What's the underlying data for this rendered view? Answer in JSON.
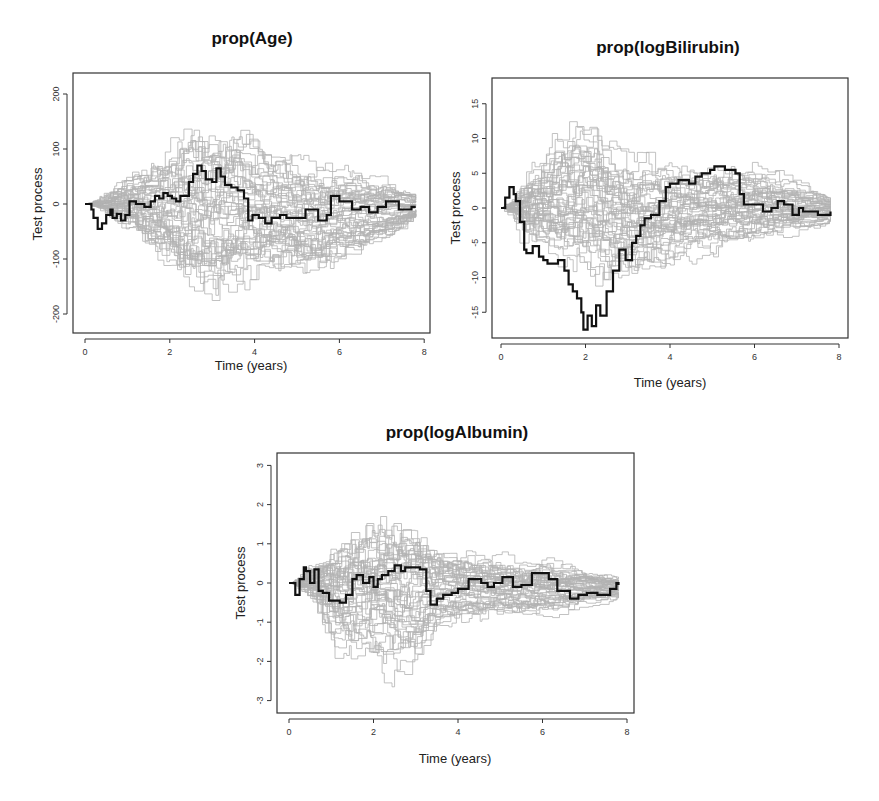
{
  "figure": {
    "panels": [
      {
        "id": "age",
        "title": "prop(Age)",
        "xlabel": "Time (years)",
        "ylabel": "Test process",
        "xticks": [
          0,
          2,
          4,
          6,
          8
        ],
        "yticks": [
          -200,
          -100,
          0,
          100,
          200
        ],
        "ytick_labels": [
          "-200",
          "-100",
          "0",
          "100",
          "200"
        ]
      },
      {
        "id": "logbilirubin",
        "title": "prop(logBilirubin)",
        "xlabel": "Time (years)",
        "ylabel": "Test process",
        "xticks": [
          0,
          2,
          4,
          6,
          8
        ],
        "yticks": [
          -15,
          -10,
          -5,
          0,
          5,
          10,
          15
        ],
        "ytick_labels": [
          "-15",
          "-10",
          "-5",
          "0",
          "5",
          "10",
          "15"
        ]
      },
      {
        "id": "logalbumin",
        "title": "prop(logAlbumin)",
        "xlabel": "Time (years)",
        "ylabel": "Test process",
        "xticks": [
          0,
          2,
          4,
          6,
          8
        ],
        "yticks": [
          -3,
          -2,
          -1,
          0,
          1,
          2,
          3
        ],
        "ytick_labels": [
          "-3",
          "-2",
          "-1",
          "0",
          "1",
          "2",
          "3"
        ]
      }
    ]
  },
  "chart_data": [
    {
      "type": "line",
      "title": "prop(Age)",
      "xlabel": "Time (years)",
      "ylabel": "Test process",
      "xlim": [
        0,
        8
      ],
      "ylim": [
        -240,
        240
      ],
      "grid": false,
      "legend": null,
      "series": [
        {
          "name": "observed",
          "color": "#111111",
          "step": true,
          "x": [
            0.0,
            0.15,
            0.2,
            0.3,
            0.4,
            0.5,
            0.6,
            0.65,
            0.75,
            0.85,
            0.95,
            1.05,
            1.2,
            1.4,
            1.55,
            1.65,
            1.75,
            1.85,
            1.95,
            2.05,
            2.15,
            2.25,
            2.45,
            2.55,
            2.65,
            2.75,
            2.85,
            3.0,
            3.1,
            3.2,
            3.3,
            3.45,
            3.6,
            3.75,
            3.85,
            3.95,
            4.1,
            4.25,
            4.4,
            4.6,
            4.75,
            5.0,
            5.2,
            5.5,
            5.7,
            5.8,
            6.0,
            6.3,
            6.5,
            6.7,
            6.9,
            7.1,
            7.4,
            7.7,
            7.8
          ],
          "y": [
            0,
            -10,
            -25,
            -45,
            -35,
            -20,
            -10,
            -25,
            -18,
            -30,
            -20,
            5,
            0,
            -5,
            5,
            15,
            10,
            20,
            15,
            10,
            5,
            15,
            40,
            55,
            70,
            60,
            45,
            40,
            65,
            50,
            35,
            30,
            25,
            10,
            -30,
            -20,
            -25,
            -35,
            -25,
            -20,
            -25,
            -25,
            -10,
            -30,
            -20,
            15,
            5,
            -10,
            -5,
            -15,
            -5,
            5,
            -10,
            -5,
            -5
          ]
        },
        {
          "name": "simulated (grey)",
          "color": "#b3b3b3",
          "count_approx": 50,
          "envelope": {
            "x": [
              0,
              1,
              2,
              2.5,
              3,
              4,
              5,
              6,
              7,
              7.8
            ],
            "upper": [
              0,
              80,
              140,
              190,
              190,
              130,
              90,
              80,
              50,
              15
            ],
            "lower": [
              0,
              -70,
              -160,
              -220,
              -200,
              -150,
              -150,
              -110,
              -70,
              -20
            ]
          }
        }
      ]
    },
    {
      "type": "line",
      "title": "prop(logBilirubin)",
      "xlabel": "Time (years)",
      "ylabel": "Test process",
      "xlim": [
        0,
        8
      ],
      "ylim": [
        -19,
        19
      ],
      "grid": false,
      "legend": null,
      "series": [
        {
          "name": "observed",
          "color": "#111111",
          "step": true,
          "x": [
            0.0,
            0.1,
            0.2,
            0.3,
            0.35,
            0.45,
            0.55,
            0.6,
            0.75,
            0.9,
            1.0,
            1.1,
            1.35,
            1.5,
            1.6,
            1.7,
            1.8,
            1.9,
            1.95,
            2.05,
            2.15,
            2.25,
            2.35,
            2.5,
            2.65,
            2.8,
            2.95,
            3.1,
            3.2,
            3.3,
            3.4,
            3.55,
            3.75,
            3.9,
            4.0,
            4.2,
            4.45,
            4.6,
            4.75,
            4.95,
            5.05,
            5.3,
            5.55,
            5.65,
            5.75,
            5.9,
            6.05,
            6.2,
            6.4,
            6.55,
            6.7,
            6.9,
            7.05,
            7.15,
            7.5,
            7.7,
            7.8
          ],
          "y": [
            0,
            1.5,
            3,
            2,
            1,
            -2,
            -6,
            -6.5,
            -5.5,
            -7,
            -7.5,
            -8,
            -7.5,
            -9,
            -11,
            -12,
            -13,
            -15,
            -17.5,
            -15.5,
            -17,
            -14,
            -15.5,
            -12,
            -9,
            -6,
            -7.5,
            -5,
            -4,
            -2.5,
            -1.5,
            -1,
            1,
            3,
            3.5,
            4,
            3.5,
            4.5,
            5,
            5.5,
            6,
            5.5,
            5,
            2,
            0.5,
            0.5,
            0.5,
            -0.5,
            0,
            1,
            0.5,
            -1,
            0,
            -0.5,
            -1,
            -1,
            -0.5
          ]
        },
        {
          "name": "simulated (grey)",
          "color": "#b3b3b3",
          "count_approx": 50,
          "envelope": {
            "x": [
              0,
              0.5,
              1,
              1.5,
              2,
              2.5,
              3,
              4,
              5,
              6,
              7,
              7.8
            ],
            "upper": [
              0,
              8,
              12,
              15.5,
              15.5,
              11,
              9,
              8,
              8,
              7.5,
              4,
              1.5
            ],
            "lower": [
              0,
              -8,
              -10.5,
              -12,
              -12.5,
              -14,
              -13,
              -9,
              -8,
              -6.5,
              -4.5,
              -2
            ]
          }
        }
      ]
    },
    {
      "type": "line",
      "title": "prop(logAlbumin)",
      "xlabel": "Time (years)",
      "ylabel": "Test process",
      "xlim": [
        0,
        8
      ],
      "ylim": [
        -3.3,
        3.3
      ],
      "grid": false,
      "legend": null,
      "series": [
        {
          "name": "observed",
          "color": "#111111",
          "step": true,
          "x": [
            0.0,
            0.15,
            0.25,
            0.35,
            0.4,
            0.5,
            0.6,
            0.7,
            0.8,
            0.95,
            1.2,
            1.35,
            1.5,
            1.6,
            1.75,
            1.9,
            2.0,
            2.1,
            2.2,
            2.35,
            2.5,
            2.65,
            2.75,
            2.9,
            3.1,
            3.25,
            3.35,
            3.5,
            3.65,
            3.85,
            4.0,
            4.25,
            4.55,
            4.7,
            4.85,
            5.05,
            5.3,
            5.5,
            5.75,
            6.15,
            6.35,
            6.65,
            6.85,
            7.05,
            7.3,
            7.6,
            7.75,
            7.8
          ],
          "y": [
            0,
            -0.3,
            0.1,
            0.4,
            0.3,
            0.0,
            0.35,
            -0.2,
            -0.25,
            -0.45,
            -0.5,
            -0.3,
            0.1,
            0.2,
            0.0,
            0.15,
            -0.1,
            0.1,
            0.2,
            0.3,
            0.45,
            0.3,
            0.4,
            0.4,
            0.35,
            -0.2,
            -0.55,
            -0.4,
            -0.3,
            -0.25,
            -0.15,
            0.1,
            0.0,
            -0.1,
            0.0,
            0.15,
            -0.1,
            -0.05,
            0.25,
            0.1,
            -0.2,
            -0.4,
            -0.3,
            -0.25,
            -0.3,
            -0.15,
            0.0,
            -0.05
          ]
        },
        {
          "name": "simulated (grey)",
          "color": "#b3b3b3",
          "count_approx": 50,
          "envelope": {
            "x": [
              0,
              0.5,
              1,
              1.5,
              2,
              2.5,
              3,
              3.25,
              4,
              5,
              6,
              7,
              7.8
            ],
            "upper": [
              0,
              0.9,
              1.6,
              2.0,
              2.1,
              2.2,
              2.0,
              1.1,
              1.0,
              0.8,
              0.7,
              0.4,
              0.15
            ],
            "lower": [
              0,
              -0.9,
              -2.5,
              -2.3,
              -2.6,
              -3.1,
              -2.6,
              -1.3,
              -1.3,
              -1.2,
              -1.0,
              -0.7,
              -0.4
            ]
          }
        }
      ]
    }
  ]
}
